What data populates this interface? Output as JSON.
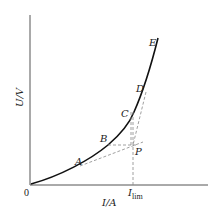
{
  "diagram": {
    "type": "voltage-current curve with limiting current construction",
    "axes": {
      "y_label": "U/V",
      "x_label": "I/A",
      "origin_label": "0",
      "x_marker_main": "I",
      "x_marker_sub": "lim"
    },
    "curve_points": [
      {
        "label": "A"
      },
      {
        "label": "B"
      },
      {
        "label": "C"
      },
      {
        "label": "D"
      },
      {
        "label": "E"
      }
    ],
    "construction_point": {
      "label": "P"
    },
    "colors": {
      "curve": "#111111",
      "axes": "#555555",
      "dashed": "#888888"
    }
  }
}
